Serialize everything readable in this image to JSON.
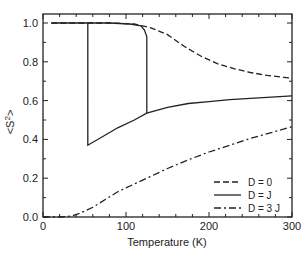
{
  "chart_data": {
    "type": "line",
    "title": "",
    "xlabel": "Temperature (K)",
    "ylabel": "<S²>",
    "xlim": [
      0,
      300
    ],
    "ylim": [
      0.0,
      1.05
    ],
    "x_ticks": [
      "0",
      "100",
      "200",
      "300"
    ],
    "y_ticks": [
      "0.0",
      "0.2",
      "0.4",
      "0.6",
      "0.8",
      "1.0"
    ],
    "grid": false,
    "legend_position": "lower right",
    "series": [
      {
        "name": "D = 0",
        "style": "dashed",
        "x": [
          10,
          40,
          80,
          110,
          120,
          130,
          150,
          170,
          190,
          210,
          230,
          250,
          270,
          290,
          300
        ],
        "y": [
          1.0,
          1.0,
          1.0,
          0.995,
          0.985,
          0.975,
          0.94,
          0.88,
          0.83,
          0.79,
          0.765,
          0.745,
          0.73,
          0.72,
          0.715
        ]
      },
      {
        "name": "D = J",
        "style": "solid",
        "x": [
          10,
          54,
          54,
          54,
          70,
          90,
          110,
          125,
          125,
          125,
          120,
          110,
          90,
          60,
          54,
          54,
          10,
          125,
          150,
          175,
          200,
          225,
          250,
          275,
          300
        ],
        "y": [
          1.0,
          1.0,
          0.37,
          0.37,
          0.41,
          0.46,
          0.5,
          0.535,
          0.93,
          0.96,
          0.98,
          0.995,
          1.0,
          1.0,
          1.0,
          1.0,
          1.0,
          0.535,
          0.565,
          0.585,
          0.595,
          0.605,
          0.612,
          0.618,
          0.625
        ],
        "notes": "Hysteresis loop: upper branch stays at ~1.0 until ~125 K, drops to ~0.535; lower branch drops from 1.0 to ~0.37 at ~54 K, then rises continuously to ~0.625 at 300 K"
      },
      {
        "name": "D = 3 J",
        "style": "dash-dot",
        "x": [
          0,
          20,
          35,
          45,
          60,
          75,
          90,
          110,
          130,
          150,
          175,
          200,
          225,
          250,
          275,
          300
        ],
        "y": [
          0.0,
          0.0,
          0.005,
          0.02,
          0.05,
          0.09,
          0.13,
          0.17,
          0.21,
          0.25,
          0.295,
          0.335,
          0.37,
          0.405,
          0.435,
          0.465
        ]
      }
    ],
    "legend": [
      "D = 0",
      "D = J",
      "D = 3 J"
    ]
  }
}
